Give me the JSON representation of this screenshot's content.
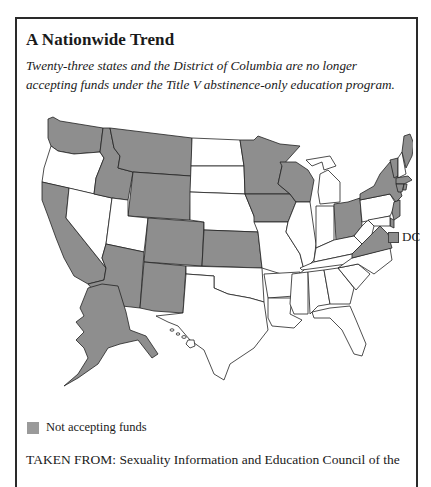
{
  "header": {
    "title": "A Nationwide Trend",
    "subtitle": "Twenty-three states and the District of Columbia are no longer accepting funds under the Title V abstinence-only education program."
  },
  "map": {
    "region": "United States",
    "legend": {
      "label": "Not accepting funds",
      "color": "#8e8e8e"
    },
    "dc_label": "DC",
    "not_accepting_states": [
      "WA",
      "ID",
      "MT",
      "WY",
      "CA",
      "AZ",
      "NM",
      "CO",
      "KS",
      "MN",
      "IA",
      "WI",
      "OH",
      "VA",
      "NY",
      "VT",
      "ME",
      "MA",
      "CT",
      "RI",
      "NJ",
      "DE",
      "AK"
    ],
    "not_accepting_district": "DC",
    "colors": {
      "not_accepting": "#8e8e8e",
      "accepting": "#ffffff",
      "border": "#222222"
    }
  },
  "source": {
    "text": "TAKEN FROM: Sexuality Information and Education Council of the"
  }
}
